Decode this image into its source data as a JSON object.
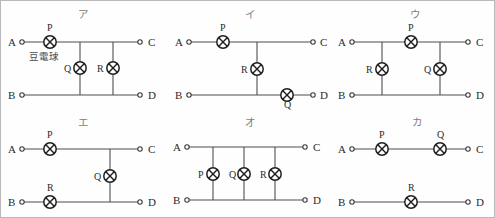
{
  "figure": {
    "caption": "豆電球",
    "bulb_symbol_name": "lamp-symbol",
    "terminal_names": [
      "A",
      "B",
      "C",
      "D"
    ],
    "lamp_names": [
      "P",
      "Q",
      "R"
    ],
    "colors": {
      "wire": "#4d4d4d",
      "lamp_outline": "#1f1f1f",
      "text": "#2b2b2b",
      "panel_label": "#7e7e7e",
      "background": "#fefefe"
    }
  },
  "panels": [
    {
      "id": "a",
      "label": "ア",
      "terminals": {
        "A": "A",
        "B": "B",
        "C": "C",
        "D": "D"
      },
      "lamps": {
        "P": "P",
        "Q": "Q",
        "R": "R"
      },
      "caption": "豆電球"
    },
    {
      "id": "i",
      "label": "イ",
      "terminals": {
        "A": "A",
        "B": "B",
        "C": "C",
        "D": "D"
      },
      "lamps": {
        "P": "P",
        "Q": "Q",
        "R": "R"
      }
    },
    {
      "id": "u",
      "label": "ウ",
      "terminals": {
        "A": "A",
        "B": "B",
        "C": "C",
        "D": "D"
      },
      "lamps": {
        "P": "P",
        "Q": "Q",
        "R": "R"
      }
    },
    {
      "id": "e",
      "label": "エ",
      "terminals": {
        "A": "A",
        "B": "B",
        "C": "C",
        "D": "D"
      },
      "lamps": {
        "P": "P",
        "Q": "Q",
        "R": "R"
      }
    },
    {
      "id": "o",
      "label": "オ",
      "terminals": {
        "A": "A",
        "B": "B",
        "C": "C",
        "D": "D"
      },
      "lamps": {
        "P": "P",
        "Q": "Q",
        "R": "R"
      }
    },
    {
      "id": "ka",
      "label": "カ",
      "terminals": {
        "A": "A",
        "B": "B",
        "C": "C",
        "D": "D"
      },
      "lamps": {
        "P": "P",
        "Q": "Q",
        "R": "R"
      }
    }
  ]
}
